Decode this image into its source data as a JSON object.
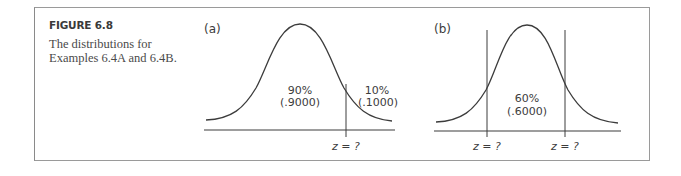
{
  "figure": {
    "title": "FIGURE 6.8",
    "caption_line1": "The distributions for",
    "caption_line2": "Examples 6.4A and 6.4B."
  },
  "panels": [
    {
      "id": "a",
      "label": "(a)",
      "regions": [
        {
          "percent": "90%",
          "proportion": "(.9000)"
        },
        {
          "percent": "10%",
          "proportion": "(.1000)"
        }
      ],
      "cut_labels": [
        "z = ?"
      ]
    },
    {
      "id": "b",
      "label": "(b)",
      "regions": [
        {
          "percent": "60%",
          "proportion": "(.6000)"
        }
      ],
      "cut_labels": [
        "z = ?",
        "z = ?"
      ]
    }
  ],
  "colors": {
    "line": "#3c3c3c",
    "frame": "#9a9a9a"
  }
}
